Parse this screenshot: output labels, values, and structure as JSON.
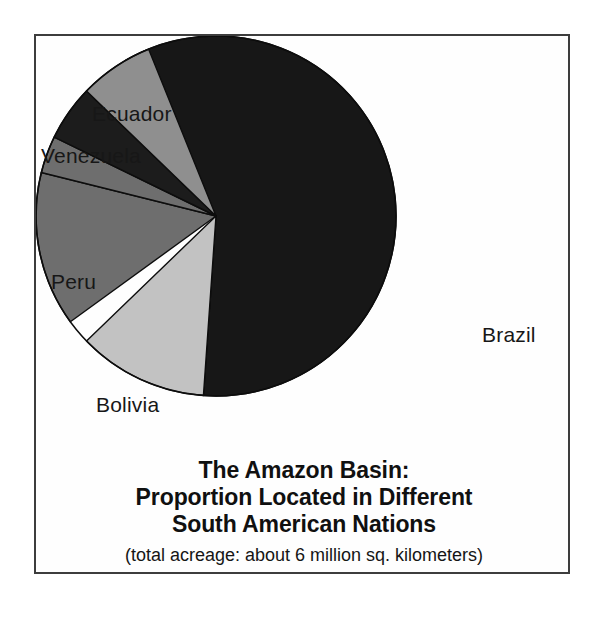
{
  "figure": {
    "background_color": "#ffffff",
    "frame_color": "#3d3d3d"
  },
  "title": {
    "line1": "The Amazon Basin:",
    "line2": "Proportion Located in Different",
    "line3": "South American Nations",
    "subtitle": "(total acreage: about 6 million sq. kilometers)"
  },
  "labels": {
    "colombia": "Colombia",
    "ecuador": "Ecuador",
    "venezuela": "Venezuela",
    "peru": "Peru",
    "bolivia": "Bolivia",
    "brazil": "Brazil"
  },
  "chart_data": {
    "type": "pie",
    "title": "The Amazon Basin: Proportion Located in Different South American Nations",
    "subtitle": "(total acreage: about 6 million sq. kilometers)",
    "legend_position": "outside-labels",
    "start_angle_deg": 330,
    "direction": "clockwise",
    "units": "percent of total area",
    "total_note": "about 6 million sq. kilometers",
    "categories": [
      "Brazil",
      "Bolivia",
      "Peru",
      "Venezuela",
      "Ecuador",
      "Colombia"
    ],
    "values": [
      59.4,
      11.7,
      13.9,
      3.3,
      5.0,
      6.7
    ],
    "slices": [
      {
        "label": "Brazil",
        "value": 59.4,
        "start_deg": 330,
        "end_deg": 544,
        "sweep_deg": 214,
        "color": "#171717",
        "label_position": "right"
      },
      {
        "label": "Bolivia",
        "value": 11.7,
        "start_deg": 184,
        "end_deg": 226,
        "sweep_deg": 42,
        "color": "#c2c2c2",
        "label_position": "lower-left"
      },
      {
        "label": "Peru",
        "value": 13.9,
        "start_deg": 234,
        "end_deg": 284,
        "sweep_deg": 50,
        "color": "#6e6e6e",
        "label_position": "left"
      },
      {
        "label": "Venezuela",
        "value": 3.3,
        "start_deg": 284,
        "end_deg": 296,
        "sweep_deg": 12,
        "color": "#6e6e6e",
        "label_position": "upper-left"
      },
      {
        "label": "Ecuador",
        "value": 5.0,
        "start_deg": 296,
        "end_deg": 314,
        "sweep_deg": 18,
        "color": "#1c1c1c",
        "label_position": "upper-left"
      },
      {
        "label": "Colombia",
        "value": 6.7,
        "start_deg": 314,
        "end_deg": 330,
        "sweep_deg": 24,
        "color": "#8f8f8f",
        "label_position": "top"
      }
    ],
    "geometry": {
      "center_x": 180,
      "center_y": 180,
      "radius": 180
    },
    "colors": {
      "brazil": "#171717",
      "bolivia": "#c2c2c2",
      "peru": "#6e6e6e",
      "venezuela": "#6e6e6e",
      "ecuador": "#1c1c1c",
      "colombia": "#8f8f8f"
    }
  }
}
